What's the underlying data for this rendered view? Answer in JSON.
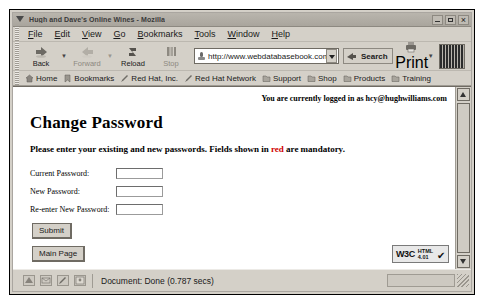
{
  "window": {
    "title": "Hugh and Dave's Online Wines - Mozilla",
    "title_icon": "mozilla-dropdown-icon",
    "minimize_label": "Minimize",
    "maximize_label": "Maximize",
    "close_label": "Close"
  },
  "menubar": {
    "items": [
      {
        "label": "File",
        "accel": "F"
      },
      {
        "label": "Edit",
        "accel": "E"
      },
      {
        "label": "View",
        "accel": "V"
      },
      {
        "label": "Go",
        "accel": "G"
      },
      {
        "label": "Bookmarks",
        "accel": "B"
      },
      {
        "label": "Tools",
        "accel": "T"
      },
      {
        "label": "Window",
        "accel": "W"
      },
      {
        "label": "Help",
        "accel": "H"
      }
    ]
  },
  "toolbar": {
    "back_label": "Back",
    "forward_label": "Forward",
    "reload_label": "Reload",
    "stop_label": "Stop",
    "print_label": "Print",
    "search_label": "Search",
    "url_value": "http://www.webdatabasebook.com/wd",
    "url_placeholder": "Enter address"
  },
  "bookmarks": {
    "items": [
      {
        "label": "Home",
        "icon": "home-icon"
      },
      {
        "label": "Bookmarks",
        "icon": "bookmark-icon"
      },
      {
        "label": "Red Hat, Inc.",
        "icon": "pencil-icon"
      },
      {
        "label": "Red Hat Network",
        "icon": "pencil-icon"
      },
      {
        "label": "Support",
        "icon": "folder-icon"
      },
      {
        "label": "Shop",
        "icon": "folder-icon"
      },
      {
        "label": "Products",
        "icon": "folder-icon"
      },
      {
        "label": "Training",
        "icon": "folder-icon"
      }
    ]
  },
  "page": {
    "logged_in_text": "You are currently logged in as hcy@hughwilliams.com",
    "heading": "Change Password",
    "intro_before": "Please enter your existing and new passwords. Fields shown in",
    "intro_red": "red",
    "intro_after": "are mandatory.",
    "red_color": "#d00000",
    "fields": [
      {
        "label": "Current Password:",
        "value": "",
        "name": "current-password"
      },
      {
        "label": "New Password:",
        "value": "",
        "name": "new-password"
      },
      {
        "label": "Re-enter New Password:",
        "value": "",
        "name": "reenter-new-password"
      }
    ],
    "submit_label": "Submit",
    "main_page_label": "Main Page",
    "w3c_left": "W3C",
    "w3c_line1": "HTML",
    "w3c_line2": "4.01"
  },
  "statusbar": {
    "text": "Document: Done (0.787 secs)"
  }
}
